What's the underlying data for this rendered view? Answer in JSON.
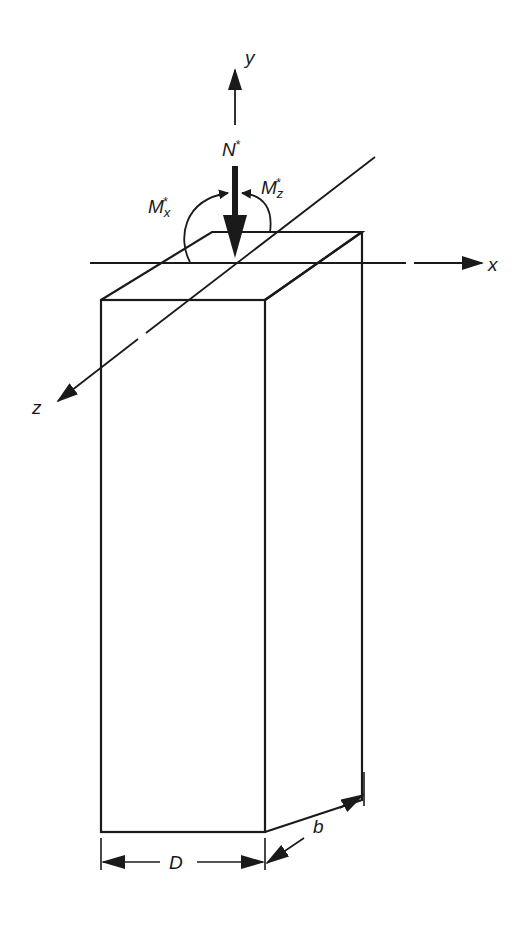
{
  "diagram": {
    "labels": {
      "y_axis": "y",
      "x_axis": "x",
      "z_axis": "z",
      "axial_load": "N",
      "axial_load_sup": "*",
      "moment_x": "M",
      "moment_x_sub": "x",
      "moment_x_sup": "*",
      "moment_z": "M",
      "moment_z_sub": "z",
      "moment_z_sup": "*",
      "dim_depth": "D",
      "dim_breadth": "b"
    },
    "colors": {
      "line": "#1a1a1a",
      "background": "#ffffff"
    }
  }
}
